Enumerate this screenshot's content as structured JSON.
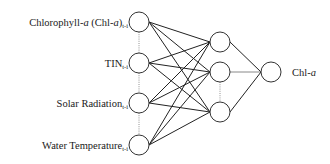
{
  "diagram": {
    "type": "neural-network",
    "inputs": [
      {
        "main": "Chlorophyll-",
        "italic": "a",
        "after": " (Chl-",
        "italic2": "a",
        "after2": ")",
        "sub": "t-i"
      },
      {
        "main": "TIN",
        "italic": "",
        "after": "",
        "italic2": "",
        "after2": "",
        "sub": "t-i"
      },
      {
        "main": "Solar Radiation",
        "italic": "",
        "after": "",
        "italic2": "",
        "after2": "",
        "sub": "t-i"
      },
      {
        "main": "Water Temperature",
        "italic": "",
        "after": "",
        "italic2": "",
        "after2": "",
        "sub": "t-i"
      }
    ],
    "hidden_count": 3,
    "output": {
      "main": "Chl-",
      "italic": "a"
    },
    "colors": {
      "edge": "#222222",
      "node_stroke": "#333333",
      "text": "#1a1a1a"
    }
  }
}
